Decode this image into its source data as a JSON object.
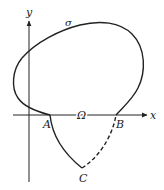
{
  "diagram": {
    "labels": {
      "y_axis": "y",
      "x_axis": "x",
      "curve": "σ",
      "point_a": "A",
      "point_b": "B",
      "point_c": "C",
      "region": "Ω"
    },
    "colors": {
      "stroke": "#222222",
      "background": "#ffffff"
    },
    "elements": {
      "axes": [
        "x-axis (horizontal, arrow right)",
        "y-axis (vertical, arrow up)"
      ],
      "closed_curve": "σ — closed loop crossing x-axis at A and B",
      "arc_ac": "solid arc from A down to C",
      "arc_cb": "dashed arc from C up to B"
    }
  }
}
